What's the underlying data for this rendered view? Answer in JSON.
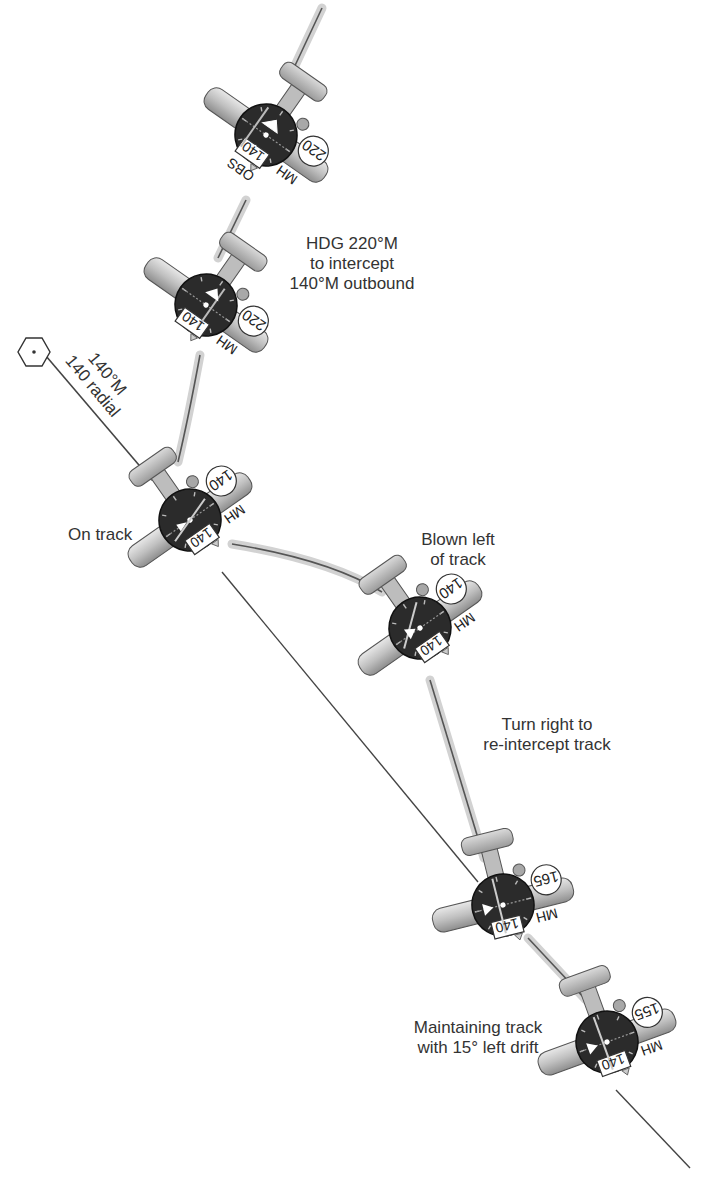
{
  "diagram": {
    "type": "VOR tracking with wind drift correction",
    "colors": {
      "background": "#ffffff",
      "track_band": "#cfcfcf",
      "track_line": "#444444",
      "instrument_face": "#2a2a2a",
      "aircraft_body": "#c4c4c4",
      "text": "#333333"
    },
    "station": {
      "icon": "vor-hexagon-icon",
      "radial_label_1": "140°M",
      "radial_label_2": "140 radial"
    },
    "annotations": {
      "intercept_1": "HDG 220°M",
      "intercept_2": "to intercept",
      "intercept_3": "140°M outbound",
      "on_track": "On track",
      "blown_1": "Blown left",
      "blown_2": "of track",
      "turn_1": "Turn right to",
      "turn_2": "re-intercept track",
      "maintain_1": "Maintaining track",
      "maintain_2": "with 15° left drift"
    },
    "aircraft": [
      {
        "id": "a1",
        "mh": "220",
        "obs": "140",
        "mh_label": "MH",
        "obs_label": "OBS",
        "cdi": "centered-far",
        "to_from": "from"
      },
      {
        "id": "a2",
        "mh": "220",
        "obs": "140",
        "mh_label": "MH",
        "cdi": "right-deflection",
        "to_from": "from"
      },
      {
        "id": "a3",
        "mh": "140",
        "obs": "140",
        "mh_label": "MH",
        "cdi": "centered",
        "to_from": "from"
      },
      {
        "id": "a4",
        "mh": "140",
        "obs": "140",
        "mh_label": "MH",
        "cdi": "right-deflection",
        "to_from": "from"
      },
      {
        "id": "a5",
        "mh": "165",
        "obs": "140",
        "mh_label": "MH",
        "cdi": "centered",
        "to_from": "from"
      },
      {
        "id": "a6",
        "mh": "155",
        "obs": "140",
        "mh_label": "MH",
        "cdi": "centered",
        "to_from": "from"
      }
    ]
  }
}
